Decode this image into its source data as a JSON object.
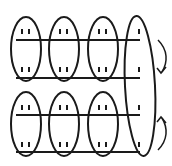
{
  "diagram": {
    "stroke_color": "#1a1a1a",
    "background": "#ffffff",
    "rows": [
      {
        "index": 1,
        "marks_per_group": [
          2,
          2,
          2,
          1
        ]
      },
      {
        "index": 2,
        "marks_per_group": [
          2,
          2,
          2,
          1
        ]
      },
      {
        "index": 3,
        "marks_per_group": [
          2,
          2,
          2,
          1
        ]
      },
      {
        "index": 4,
        "marks_per_group": [
          2,
          2,
          2,
          1
        ]
      }
    ],
    "ovals": {
      "small_count": 6,
      "tall_count": 1
    },
    "arrows": [
      {
        "from_row": 1,
        "to_row": 2,
        "direction": "down"
      },
      {
        "from_row": 4,
        "to_row": 3,
        "direction": "up"
      }
    ]
  }
}
